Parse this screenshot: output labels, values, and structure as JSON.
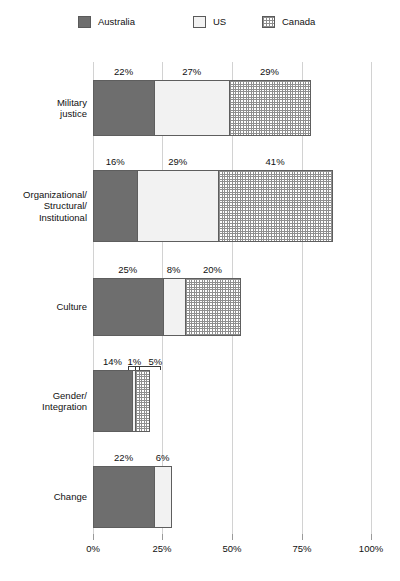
{
  "chart_data": {
    "type": "bar",
    "orientation": "horizontal",
    "stacked": true,
    "title": "",
    "xlabel": "",
    "ylabel": "",
    "xlim": [
      0,
      100
    ],
    "xticks": [
      "0%",
      "25%",
      "50%",
      "75%",
      "100%"
    ],
    "xtick_values": [
      0,
      25,
      50,
      75,
      100
    ],
    "grid": true,
    "legend_position": "top",
    "categories": [
      "Military justice",
      "Organizational/ Structural/ Institutional",
      "Culture",
      "Gender/ Integration",
      "Change"
    ],
    "series": [
      {
        "name": "Australia",
        "color": "#6e6e6e",
        "pattern": "solid-dark-gray",
        "values": [
          22,
          16,
          25,
          14,
          22
        ],
        "labels": [
          "22%",
          "16%",
          "25%",
          "14%",
          "22%"
        ]
      },
      {
        "name": "US",
        "color": "#f2f2f2",
        "pattern": "solid-light",
        "values": [
          27,
          29,
          8,
          1,
          6
        ],
        "labels": [
          "27%",
          "29%",
          "8%",
          "1%",
          "6%"
        ]
      },
      {
        "name": "Canada",
        "color": "#ffffff",
        "pattern": "crosshatch-grid",
        "values": [
          29,
          41,
          20,
          5,
          0
        ],
        "labels": [
          "29%",
          "41%",
          "20%",
          "5%",
          ""
        ]
      }
    ]
  },
  "legend": {
    "items": [
      {
        "label": "Australia",
        "icon": "legend-swatch-australia"
      },
      {
        "label": "US",
        "icon": "legend-swatch-us"
      },
      {
        "label": "Canada",
        "icon": "legend-swatch-canada"
      }
    ]
  },
  "axis": {
    "x_tick_labels": [
      "0%",
      "25%",
      "50%",
      "75%",
      "100%"
    ]
  },
  "rows": [
    {
      "label_lines": [
        "Military",
        "justice"
      ],
      "segments": [
        {
          "series": "Australia",
          "value": 22,
          "label": "22%"
        },
        {
          "series": "US",
          "value": 27,
          "label": "27%"
        },
        {
          "series": "Canada",
          "value": 29,
          "label": "29%"
        }
      ]
    },
    {
      "label_lines": [
        "Organizational/",
        "Structural/",
        "Institutional"
      ],
      "segments": [
        {
          "series": "Australia",
          "value": 16,
          "label": "16%"
        },
        {
          "series": "US",
          "value": 29,
          "label": "29%"
        },
        {
          "series": "Canada",
          "value": 41,
          "label": "41%"
        }
      ]
    },
    {
      "label_lines": [
        "Culture"
      ],
      "segments": [
        {
          "series": "Australia",
          "value": 25,
          "label": "25%"
        },
        {
          "series": "US",
          "value": 8,
          "label": "8%"
        },
        {
          "series": "Canada",
          "value": 20,
          "label": "20%"
        }
      ]
    },
    {
      "label_lines": [
        "Gender/",
        "Integration"
      ],
      "segments": [
        {
          "series": "Australia",
          "value": 14,
          "label": "14%"
        },
        {
          "series": "US",
          "value": 1,
          "label": "1%"
        },
        {
          "series": "Canada",
          "value": 5,
          "label": "5%"
        }
      ]
    },
    {
      "label_lines": [
        "Change"
      ],
      "segments": [
        {
          "series": "Australia",
          "value": 22,
          "label": "22%"
        },
        {
          "series": "US",
          "value": 6,
          "label": "6%"
        }
      ]
    }
  ]
}
